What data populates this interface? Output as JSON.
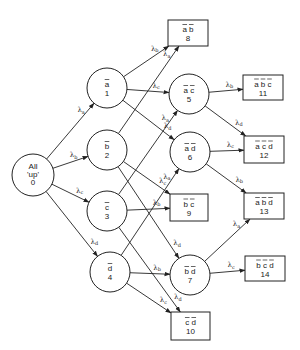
{
  "diagram": {
    "type": "state-transition-graph",
    "nodes": [
      {
        "id": 0,
        "shape": "circle",
        "lines": [
          "All",
          "'up'",
          "0"
        ],
        "cx": 33,
        "cy": 175,
        "r": 21
      },
      {
        "id": 1,
        "shape": "circle",
        "label": "a",
        "num": "1",
        "cx": 107,
        "cy": 88,
        "r": 20
      },
      {
        "id": 2,
        "shape": "circle",
        "label": "b",
        "num": "2",
        "cx": 107,
        "cy": 150,
        "r": 20
      },
      {
        "id": 3,
        "shape": "circle",
        "label": "c",
        "num": "3",
        "cx": 107,
        "cy": 211,
        "r": 20
      },
      {
        "id": 4,
        "shape": "circle",
        "label": "d",
        "num": "4",
        "cx": 110,
        "cy": 272,
        "r": 20
      },
      {
        "id": 5,
        "shape": "circle",
        "label": "a c",
        "num": "5",
        "cx": 189,
        "cy": 94,
        "r": 20
      },
      {
        "id": 6,
        "shape": "circle",
        "label": "a d",
        "num": "6",
        "cx": 190,
        "cy": 152,
        "r": 20
      },
      {
        "id": 7,
        "shape": "circle",
        "label": "b d",
        "num": "7",
        "cx": 190,
        "cy": 275,
        "r": 20
      },
      {
        "id": 8,
        "shape": "box",
        "label": "a b",
        "num": "8",
        "x": 168,
        "y": 20,
        "w": 40,
        "h": 26
      },
      {
        "id": 9,
        "shape": "box",
        "label": "b c",
        "num": "9",
        "x": 170,
        "y": 194,
        "w": 38,
        "h": 27
      },
      {
        "id": 10,
        "shape": "box",
        "label": "c d",
        "num": "10",
        "x": 171,
        "y": 312,
        "w": 39,
        "h": 28
      },
      {
        "id": 11,
        "shape": "box",
        "label": "a b c",
        "num": "11",
        "x": 243,
        "y": 75,
        "w": 40,
        "h": 25
      },
      {
        "id": 12,
        "shape": "box",
        "label": "a c d",
        "num": "12",
        "x": 244,
        "y": 136,
        "w": 40,
        "h": 27
      },
      {
        "id": 13,
        "shape": "box",
        "label": "a b d",
        "num": "13",
        "x": 244,
        "y": 193,
        "w": 40,
        "h": 26
      },
      {
        "id": 14,
        "shape": "box",
        "label": "b c d",
        "num": "14",
        "x": 245,
        "y": 256,
        "w": 40,
        "h": 25
      }
    ],
    "edges": [
      {
        "from": 0,
        "to": 1,
        "rate": "a"
      },
      {
        "from": 0,
        "to": 2,
        "rate": "b"
      },
      {
        "from": 0,
        "to": 3,
        "rate": "c"
      },
      {
        "from": 0,
        "to": 4,
        "rate": "d"
      },
      {
        "from": 1,
        "to": 8,
        "rate": "b"
      },
      {
        "from": 2,
        "to": 8,
        "rate": "a"
      },
      {
        "from": 1,
        "to": 5,
        "rate": "c"
      },
      {
        "from": 3,
        "to": 5,
        "rate": "a"
      },
      {
        "from": 1,
        "to": 6,
        "rate": "d"
      },
      {
        "from": 4,
        "to": 6,
        "rate": "a"
      },
      {
        "from": 2,
        "to": 9,
        "rate": "c"
      },
      {
        "from": 3,
        "to": 9,
        "rate": "b"
      },
      {
        "from": 2,
        "to": 7,
        "rate": "d"
      },
      {
        "from": 4,
        "to": 7,
        "rate": "b"
      },
      {
        "from": 3,
        "to": 10,
        "rate": "d"
      },
      {
        "from": 4,
        "to": 10,
        "rate": "c"
      },
      {
        "from": 5,
        "to": 11,
        "rate": "b"
      },
      {
        "from": 5,
        "to": 12,
        "rate": "d"
      },
      {
        "from": 6,
        "to": 12,
        "rate": "c"
      },
      {
        "from": 6,
        "to": 13,
        "rate": "b"
      },
      {
        "from": 7,
        "to": 13,
        "rate": "a"
      },
      {
        "from": 7,
        "to": 14,
        "rate": "c"
      }
    ],
    "rate_symbol": "λ"
  }
}
